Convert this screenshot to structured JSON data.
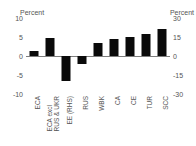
{
  "chart_data": {
    "type": "bar",
    "title": "",
    "subtitle": "",
    "xlabel": "",
    "ylabel": "Percent",
    "ylabel_right": "Percent",
    "categories": [
      "ECA",
      "ECA excl RUS & UKR",
      "EE (RHS)",
      "RUS",
      "WBK",
      "CA",
      "CE",
      "TUR",
      "SCC"
    ],
    "category_lines": [
      [
        "ECA"
      ],
      [
        "ECA excl",
        "RUS & UKR"
      ],
      [
        "EE (RHS)"
      ],
      [
        "RUS"
      ],
      [
        "WBK"
      ],
      [
        "CA"
      ],
      [
        "CE"
      ],
      [
        "TUR"
      ],
      [
        "SCC"
      ]
    ],
    "values": [
      1.3,
      4.8,
      -6.5,
      -2.0,
      3.4,
      4.4,
      5.0,
      5.7,
      7.2
    ],
    "axis_assignment": [
      "left",
      "left",
      "right",
      "left",
      "left",
      "left",
      "left",
      "left",
      "left"
    ],
    "ylim": [
      -10,
      10
    ],
    "yticks": [
      10,
      5,
      0,
      -5,
      -10
    ],
    "ytick_labels": [
      "10",
      "5",
      "0",
      "-5",
      "-10"
    ],
    "ylim_right": [
      -30,
      30
    ],
    "yticks_right": [
      30,
      15,
      0,
      -15,
      -30
    ],
    "ytick_labels_right": [
      "30",
      "15",
      "0",
      "-15",
      "-30"
    ],
    "grid": false,
    "legend": "none",
    "bar_color": "#0a0a0a",
    "axis_color": "#7d7d7d",
    "text_color": "#555555",
    "background": "#ffffff"
  },
  "axes": {
    "left_caption": "Percent",
    "right_caption": "Percent"
  }
}
